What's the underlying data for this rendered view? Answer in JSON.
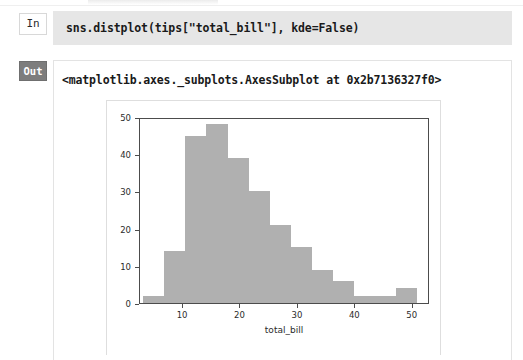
{
  "notebook": {
    "input": {
      "prompt_label": "In",
      "code": "sns.distplot(tips[\"total_bill\"], kde=False)"
    },
    "output": {
      "prompt_label": "Out",
      "repr_text": "<matplotlib.axes._subplots.AxesSubplot at 0x2b7136327f0>"
    }
  },
  "chart_data": {
    "type": "bar",
    "title": "",
    "xlabel": "total_bill",
    "ylabel": "",
    "xlim": [
      2.5,
      53.0
    ],
    "ylim": [
      0,
      50
    ],
    "grid": false,
    "legend": null,
    "bar_color": "#b0b0b0",
    "axes_color": "#4c4c4c",
    "xticks": [
      10,
      20,
      30,
      40,
      50
    ],
    "yticks": [
      0,
      10,
      20,
      30,
      40,
      50
    ],
    "bin_edges": [
      3.07,
      6.74,
      10.41,
      14.08,
      17.75,
      21.42,
      25.09,
      28.76,
      32.43,
      36.1,
      39.77,
      43.44,
      47.11,
      50.78
    ],
    "bin_centers": [
      4.9,
      8.6,
      12.2,
      15.9,
      19.6,
      23.3,
      26.9,
      30.6,
      34.3,
      37.9,
      41.6,
      45.3,
      48.9
    ],
    "values": [
      2,
      14,
      45,
      48,
      39,
      30,
      21,
      15,
      9,
      6,
      2,
      2,
      4
    ]
  }
}
